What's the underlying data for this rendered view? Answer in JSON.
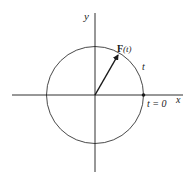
{
  "diagram": {
    "labels": {
      "y_axis": "y",
      "x_axis": "x",
      "vector_bold": "F",
      "vector_arg": "(t)",
      "arc_param": "t",
      "start_point": "t = 0"
    },
    "colors": {
      "stroke": "#1a1a1a",
      "background": "#ffffff"
    }
  }
}
